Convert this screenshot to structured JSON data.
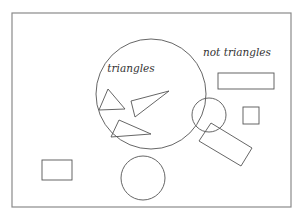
{
  "diagram": {
    "type": "set-classification (Venn-style)",
    "labels": {
      "inside_set": "triangles",
      "outside_set": "not triangles"
    },
    "colors": {
      "background": "#ffffff",
      "frame_stroke": "#8a8a8a",
      "shape_stroke": "#555555",
      "text": "#333333"
    },
    "universe_frame": {
      "x": 12,
      "y": 13,
      "width": 279,
      "height": 194
    },
    "set_circle": {
      "cx": 151,
      "cy": 94,
      "r": 55
    },
    "triangles": [
      {
        "points": "108,89 99,110 125,109"
      },
      {
        "points": "131,101 169,91 135,117"
      },
      {
        "points": "119,120 111,137 151,134"
      }
    ],
    "non_triangles": {
      "rectangles": [
        {
          "name": "wide-rectangle",
          "x": 218,
          "y": 73,
          "width": 56,
          "height": 16
        },
        {
          "name": "small-square",
          "x": 243,
          "y": 107,
          "width": 16,
          "height": 17
        },
        {
          "name": "bottom-left-rectangle",
          "x": 42,
          "y": 160,
          "width": 30,
          "height": 20
        }
      ],
      "rotated_rectangle": {
        "points": "199,141 211,123 252,148 241,166"
      },
      "circles": [
        {
          "name": "small-circle",
          "cx": 209,
          "cy": 115,
          "r": 17
        },
        {
          "name": "bottom-circle",
          "cx": 143,
          "cy": 178,
          "r": 22
        }
      ]
    }
  }
}
